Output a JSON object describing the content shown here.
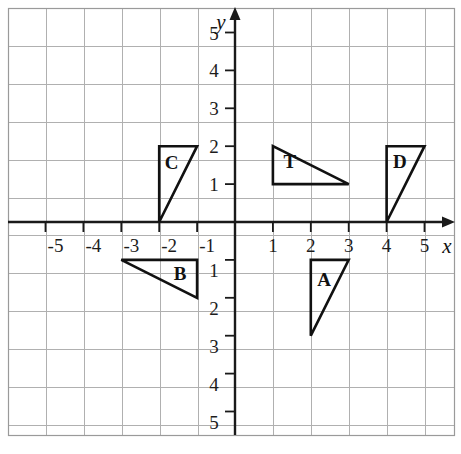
{
  "chart_data": {
    "type": "scatter",
    "title": "",
    "xlabel": "x",
    "ylabel": "y",
    "xlim": [
      -6,
      6
    ],
    "ylim": [
      -6,
      6
    ],
    "grid": true,
    "grid_step": 1,
    "legend": "none",
    "x_ticks": [
      -5,
      -4,
      -3,
      -2,
      -1,
      1,
      2,
      3,
      4,
      5
    ],
    "y_ticks": [
      5,
      4,
      3,
      2,
      1,
      -1,
      -2,
      -3,
      -4,
      -5
    ],
    "x_tick_labels": [
      "-5",
      "-4",
      "-3",
      "-2",
      "-1",
      "1",
      "2",
      "3",
      "4",
      "5"
    ],
    "y_tick_labels": [
      "5",
      "4",
      "3",
      "2",
      "1",
      "1",
      "2",
      "3",
      "4",
      "5"
    ],
    "annotations": [
      {
        "label": "T",
        "at": [
          1.45,
          1.6
        ]
      },
      {
        "label": "A",
        "at": [
          2.35,
          -1.5
        ]
      },
      {
        "label": "B",
        "at": [
          -1.45,
          -1.35
        ]
      },
      {
        "label": "C",
        "at": [
          -1.67,
          1.58
        ]
      },
      {
        "label": "D",
        "at": [
          4.35,
          1.6
        ]
      }
    ],
    "shapes": [
      {
        "name": "triangle-T",
        "label": "T",
        "type": "polygon",
        "vertices": [
          [
            1,
            2
          ],
          [
            1,
            1
          ],
          [
            3,
            1
          ]
        ]
      },
      {
        "name": "triangle-A",
        "label": "A",
        "type": "polygon",
        "vertices": [
          [
            2,
            -1
          ],
          [
            3,
            -1
          ],
          [
            2,
            -3
          ]
        ]
      },
      {
        "name": "triangle-B",
        "label": "B",
        "type": "polygon",
        "vertices": [
          [
            -3,
            -1
          ],
          [
            -1,
            -1
          ],
          [
            -1,
            -2
          ]
        ]
      },
      {
        "name": "triangle-C",
        "label": "C",
        "type": "polygon",
        "vertices": [
          [
            -2,
            2
          ],
          [
            -1,
            2
          ],
          [
            -2,
            0
          ]
        ]
      },
      {
        "name": "triangle-D",
        "label": "D",
        "type": "polygon",
        "vertices": [
          [
            4,
            2
          ],
          [
            5,
            2
          ],
          [
            4,
            0
          ]
        ]
      }
    ]
  },
  "colors": {
    "grid": "#b0b0b0",
    "axis": "#1a1a1a",
    "shape_stroke": "#111111",
    "background": "#ffffff",
    "text": "#1c1c1c"
  }
}
